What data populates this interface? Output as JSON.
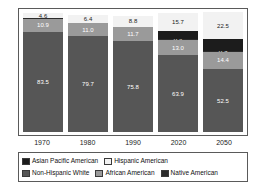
{
  "chart_data": {
    "type": "bar",
    "subtype": "stacked-percent",
    "title": "",
    "xlabel": "",
    "ylabel": "",
    "ylim": [
      0,
      100
    ],
    "grid": false,
    "legend_position": "bottom",
    "categories": [
      "1970",
      "1980",
      "1990",
      "2020",
      "2050"
    ],
    "series": [
      {
        "name": "Hispanic American",
        "color": "#f2f2f2",
        "label_color": "#222222",
        "values": [
          4.6,
          6.4,
          8.8,
          15.7,
          22.5
        ],
        "labels": [
          "4.6",
          "6.4",
          "8.8",
          "15.7",
          "22.5"
        ]
      },
      {
        "name": "Asian Pacific American",
        "color": "#1c1c1c",
        "label_color": "#f5f5f5",
        "values": [
          0.0,
          0.0,
          0.0,
          6.6,
          9.4
        ],
        "labels": [
          "",
          "",
          "",
          "",
          ""
        ]
      },
      {
        "name": "Native American",
        "color": "#2b2b2b",
        "label_color": "#f5f5f5",
        "values": [
          0.4,
          0.4,
          0.4,
          0.4,
          0.9
        ],
        "labels": [
          "",
          "",
          "",
          "0.4",
          "0.9"
        ]
      },
      {
        "name": "African American",
        "color": "#9a9a9a",
        "label_color": "#ffffff",
        "values": [
          10.9,
          11.0,
          11.7,
          13.0,
          14.4
        ],
        "labels": [
          "10.9",
          "11.0",
          "11.7",
          "13.0",
          "14.4"
        ]
      },
      {
        "name": "Non-Hispanic White",
        "color": "#565656",
        "label_color": "#ffffff",
        "values": [
          83.5,
          79.7,
          75.8,
          63.9,
          52.5
        ],
        "labels": [
          "83.5",
          "79.7",
          "75.8",
          "63.9",
          "52.5"
        ]
      }
    ]
  },
  "axis": {
    "ticks": [
      "1970",
      "1980",
      "1990",
      "2020",
      "2050"
    ]
  },
  "legend": {
    "row1": [
      {
        "label": "Asian Pacific American",
        "color": "#1c1c1c"
      },
      {
        "label": "Hispanic American",
        "color": "#f2f2f2"
      }
    ],
    "row2": [
      {
        "label": "Non-Hispanic White",
        "color": "#565656"
      },
      {
        "label": "African American",
        "color": "#9a9a9a"
      },
      {
        "label": "Native American",
        "color": "#2b2b2b"
      }
    ]
  }
}
